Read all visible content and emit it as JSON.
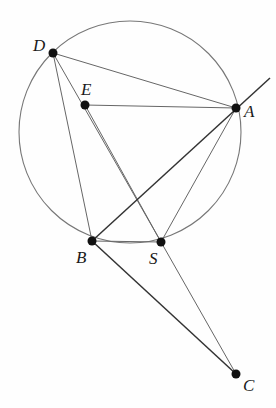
{
  "diagram": {
    "type": "geometry",
    "circle": {
      "cx": 130,
      "cy": 132,
      "r": 111
    },
    "points": [
      {
        "name": "D",
        "x": 53,
        "y": 53,
        "label_x": 33,
        "label_y": 37
      },
      {
        "name": "E",
        "x": 85,
        "y": 105,
        "label_x": 81,
        "label_y": 81
      },
      {
        "name": "A",
        "x": 236,
        "y": 108,
        "label_x": 244,
        "label_y": 103
      },
      {
        "name": "B",
        "x": 92,
        "y": 241,
        "label_x": 76,
        "label_y": 249
      },
      {
        "name": "S",
        "x": 161,
        "y": 242,
        "label_x": 149,
        "label_y": 250
      },
      {
        "name": "C",
        "x": 236,
        "y": 374,
        "label_x": 243,
        "label_y": 377
      }
    ],
    "segments": [
      [
        "D",
        "A"
      ],
      [
        "D",
        "B"
      ],
      [
        "D",
        "S"
      ],
      [
        "E",
        "A"
      ],
      [
        "E",
        "S"
      ],
      [
        "A",
        "S"
      ],
      [
        "B",
        "C"
      ],
      [
        "S",
        "C"
      ],
      [
        "B",
        "S"
      ]
    ],
    "rays": [
      {
        "from": "B",
        "through": "A",
        "to_x": 270,
        "to_y": 78
      }
    ],
    "arcs": [
      {
        "from": "B",
        "to": "S",
        "note": "short arc of circle below chord BS"
      }
    ]
  }
}
